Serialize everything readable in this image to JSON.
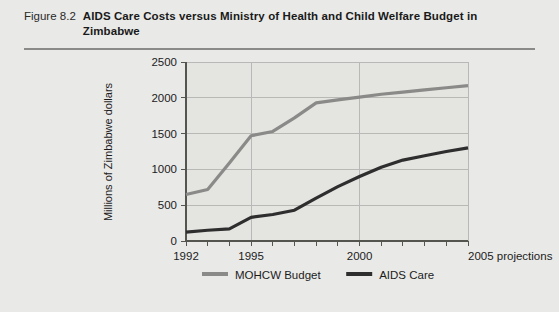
{
  "figure": {
    "number": "Figure 8.2",
    "title": "AIDS Care Costs versus Ministry of Health and Child Welfare Budget in Zimbabwe"
  },
  "chart_data": {
    "type": "line",
    "title": "AIDS Care Costs versus Ministry of Health and Child Welfare Budget in Zimbabwe",
    "xlabel": "",
    "ylabel": "Millions of Zimbabwe dollars",
    "x_axis_note": "2005 projections",
    "x": [
      1992,
      1993,
      1994,
      1995,
      1996,
      1997,
      1998,
      1999,
      2000,
      2001,
      2002,
      2003,
      2004,
      2005
    ],
    "xlim": [
      1992,
      2005
    ],
    "ylim": [
      0,
      2500
    ],
    "yticks": [
      0,
      500,
      1000,
      1500,
      2000,
      2500
    ],
    "xticks": [
      1992,
      1995,
      2000,
      2005
    ],
    "xtick_labels": [
      "1992",
      "1995",
      "2000",
      "2005 projections"
    ],
    "grid": "horizontal-and-vertical",
    "legend_position": "bottom",
    "series": [
      {
        "name": "MOHCW Budget",
        "color": "#8a8a88",
        "values": [
          650,
          720,
          1090,
          1470,
          1530,
          1720,
          1930,
          1970,
          2010,
          2050,
          2080,
          2110,
          2140,
          2170
        ]
      },
      {
        "name": "AIDS Care",
        "color": "#2e2e2e",
        "values": [
          125,
          150,
          170,
          330,
          370,
          430,
          600,
          760,
          900,
          1030,
          1130,
          1190,
          1250,
          1300
        ]
      }
    ]
  },
  "legend": {
    "items": [
      {
        "label": "MOHCW Budget",
        "color": "#8a8a88"
      },
      {
        "label": "AIDS Care",
        "color": "#2e2e2e"
      }
    ]
  },
  "y_axis": {
    "title": "Millions of Zimbabwe dollars",
    "ticks": [
      "0",
      "500",
      "1000",
      "1500",
      "2000",
      "2500"
    ]
  },
  "x_axis": {
    "ticks": [
      "1992",
      "1995",
      "2000",
      "2005 projections"
    ]
  }
}
